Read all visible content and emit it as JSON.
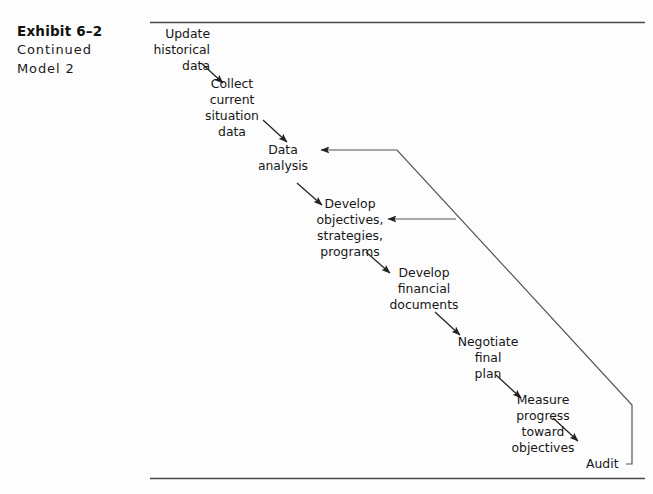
{
  "caption": {
    "title": "Exhibit 6–2",
    "line2": "Continued",
    "line3": "Model 2"
  },
  "rules": {
    "top_rule_label": "top-horizontal-rule",
    "bottom_rule_label": "bottom-horizontal-rule"
  },
  "diagram": {
    "type": "flowchart",
    "title": "Exhibit 6–2 Continued Model 2",
    "orientation": "top-left to bottom-right cascade with feedback loop",
    "nodes": [
      {
        "id": "update_historical_data",
        "lines": [
          "Update",
          "historical",
          "data"
        ],
        "align": "right"
      },
      {
        "id": "collect_current_situation",
        "lines": [
          "Collect",
          "current",
          "situation",
          "data"
        ],
        "align": "center"
      },
      {
        "id": "data_analysis",
        "lines": [
          "Data",
          "analysis"
        ],
        "align": "center"
      },
      {
        "id": "develop_objectives",
        "lines": [
          "Develop",
          "objectives,",
          "strategies,",
          "programs"
        ],
        "align": "center"
      },
      {
        "id": "develop_financial_documents",
        "lines": [
          "Develop",
          "financial",
          "documents"
        ],
        "align": "center"
      },
      {
        "id": "negotiate_final_plan",
        "lines": [
          "Negotiate",
          "final",
          "plan"
        ],
        "align": "center"
      },
      {
        "id": "measure_progress",
        "lines": [
          "Measure",
          "progress",
          "toward",
          "objectives"
        ],
        "align": "center"
      },
      {
        "id": "audit",
        "lines": [
          "Audit"
        ],
        "align": "left"
      }
    ],
    "flow_edges": [
      {
        "from": "update_historical_data",
        "to": "collect_current_situation",
        "style": "diagonal-arrow"
      },
      {
        "from": "collect_current_situation",
        "to": "data_analysis",
        "style": "diagonal-arrow"
      },
      {
        "from": "data_analysis",
        "to": "develop_objectives",
        "style": "diagonal-arrow"
      },
      {
        "from": "develop_objectives",
        "to": "develop_financial_documents",
        "style": "diagonal-arrow"
      },
      {
        "from": "develop_financial_documents",
        "to": "negotiate_final_plan",
        "style": "diagonal-arrow"
      },
      {
        "from": "negotiate_final_plan",
        "to": "measure_progress",
        "style": "diagonal-arrow"
      },
      {
        "from": "measure_progress",
        "to": "audit",
        "style": "diagonal-arrow"
      }
    ],
    "feedback_edges": [
      {
        "from": "audit",
        "to": "data_analysis",
        "style": "polyline-arrow",
        "note": "outer return path up and left"
      },
      {
        "from": "audit",
        "to": "develop_objectives",
        "style": "branch-arrow",
        "note": "branch off the return path"
      }
    ]
  },
  "artifact": {
    "bleed_text": "· · ·   · ·   · · ·"
  },
  "colors": {
    "background": "#fdfdfd",
    "ink": "#161616",
    "rule": "#4a4a4a",
    "line": "#555555"
  }
}
